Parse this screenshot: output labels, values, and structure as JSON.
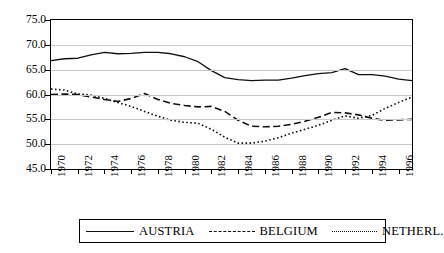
{
  "chart_data": {
    "type": "line",
    "title": "",
    "subtitle": "",
    "xlabel": "",
    "ylabel": "",
    "ylim": [
      45.0,
      75.0
    ],
    "xlim": [
      1970,
      1997
    ],
    "yticks": [
      "45.0",
      "50.0",
      "55.0",
      "60.0",
      "65.0",
      "70.0",
      "75.0"
    ],
    "ytick_values": [
      45.0,
      50.0,
      55.0,
      60.0,
      65.0,
      70.0,
      75.0
    ],
    "xticks": [
      "1970",
      "1972",
      "1974",
      "1976",
      "1978",
      "1980",
      "1982",
      "1984",
      "1986",
      "1988",
      "1990",
      "1992",
      "1994",
      "1996"
    ],
    "xtick_values": [
      1970,
      1972,
      1974,
      1976,
      1978,
      1980,
      1982,
      1984,
      1986,
      1988,
      1990,
      1992,
      1994,
      1996
    ],
    "grid": true,
    "grid_axis": "y",
    "legend_position": "bottom",
    "x": [
      1970,
      1971,
      1972,
      1973,
      1974,
      1975,
      1976,
      1977,
      1978,
      1979,
      1980,
      1981,
      1982,
      1983,
      1984,
      1985,
      1986,
      1987,
      1988,
      1989,
      1990,
      1991,
      1992,
      1993,
      1994,
      1995,
      1996,
      1997
    ],
    "series": [
      {
        "name": "AUSTRIA",
        "style": "solid",
        "color": "#111111",
        "values": [
          66.8,
          67.2,
          67.3,
          68.0,
          68.5,
          68.2,
          68.3,
          68.5,
          68.5,
          68.2,
          67.6,
          66.6,
          64.8,
          63.4,
          63.0,
          62.8,
          62.9,
          62.9,
          63.3,
          63.8,
          64.2,
          64.4,
          65.2,
          64.0,
          64.0,
          63.7,
          63.1,
          62.8
        ]
      },
      {
        "name": "BELGIUM",
        "style": "dashed",
        "color": "#111111",
        "values": [
          60.0,
          60.1,
          60.0,
          59.5,
          59.0,
          58.6,
          59.2,
          60.2,
          59.0,
          58.2,
          57.8,
          57.5,
          57.6,
          56.6,
          54.8,
          53.6,
          53.5,
          53.6,
          54.0,
          54.6,
          55.4,
          56.4,
          56.3,
          55.9,
          55.2,
          54.8,
          54.9,
          55.0
        ]
      },
      {
        "name": "NETHERL.",
        "style": "dotted",
        "color": "#111111",
        "values": [
          61.1,
          60.9,
          60.1,
          59.9,
          59.2,
          58.4,
          57.6,
          56.6,
          55.6,
          54.8,
          54.4,
          54.2,
          53.0,
          51.4,
          50.2,
          50.2,
          50.6,
          51.3,
          52.2,
          53.0,
          53.8,
          54.8,
          55.7,
          55.2,
          55.8,
          57.2,
          58.4,
          59.5
        ]
      }
    ]
  },
  "legend": {
    "items": [
      {
        "label": "AUSTRIA",
        "style": "solid"
      },
      {
        "label": "BELGIUM",
        "style": "dashed"
      },
      {
        "label": "NETHERL.",
        "style": "dotted"
      }
    ]
  }
}
